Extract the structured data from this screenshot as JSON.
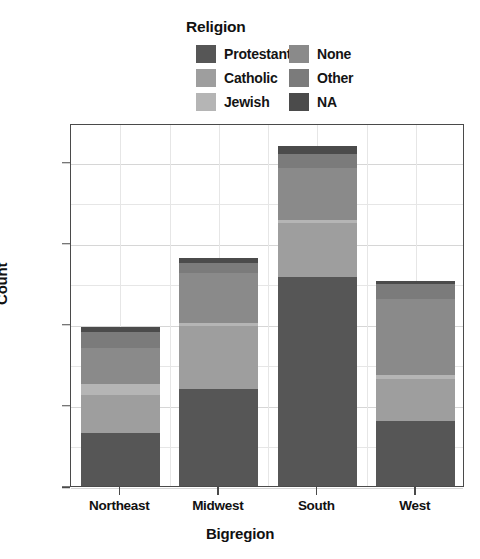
{
  "chart_data": {
    "type": "bar",
    "subtype": "stacked-bar",
    "title": "Religion",
    "xlabel": "Bigregion",
    "ylabel": "Count",
    "categories": [
      "Northeast",
      "Midwest",
      "South",
      "West"
    ],
    "series": [
      {
        "name": "Protestant",
        "color": "#565656",
        "values": [
          165,
          300,
          645,
          200
        ]
      },
      {
        "name": "Catholic",
        "color": "#9e9e9e",
        "values": [
          115,
          195,
          165,
          130
        ]
      },
      {
        "name": "Jewish",
        "color": "#b5b5b5",
        "values": [
          35,
          8,
          10,
          12
        ]
      },
      {
        "name": "None",
        "color": "#8a8a8a",
        "values": [
          110,
          155,
          160,
          235
        ]
      },
      {
        "name": "Other",
        "color": "#7b7b7b",
        "values": [
          50,
          30,
          45,
          45
        ]
      },
      {
        "name": "NA",
        "color": "#4b4b4b",
        "values": [
          15,
          15,
          25,
          10
        ]
      }
    ],
    "totals": [
      490,
      703,
      1050,
      632
    ],
    "ylim": [
      0,
      1120
    ],
    "ytick_values": [
      0,
      250,
      500,
      750,
      1000
    ],
    "ytick_labels": [
      "0",
      "250",
      "500",
      "750",
      "1.00"
    ],
    "minor_ytick_values": [
      125,
      375,
      625,
      875
    ],
    "grid": true,
    "legend_position": "top",
    "legend_columns": 2,
    "legend_entries_left": [
      "Protestant",
      "Catholic",
      "Jewish"
    ],
    "legend_entries_right": [
      "None",
      "Other",
      "NA"
    ]
  },
  "legend": {
    "title": "Religion",
    "columns": [
      {
        "id": "left",
        "items": [
          {
            "label": "Protestant",
            "color": "#565656"
          },
          {
            "label": "Catholic",
            "color": "#9e9e9e"
          },
          {
            "label": "Jewish",
            "color": "#b5b5b5"
          }
        ]
      },
      {
        "id": "right",
        "items": [
          {
            "label": "None",
            "color": "#8a8a8a"
          },
          {
            "label": "Other",
            "color": "#7b7b7b"
          },
          {
            "label": "NA",
            "color": "#4b4b4b"
          }
        ]
      }
    ]
  },
  "axes": {
    "y": {
      "label": "Count",
      "ticks": [
        {
          "label": "1.00",
          "value": 1000
        },
        {
          "label": "750",
          "value": 750
        },
        {
          "label": "500",
          "value": 500
        },
        {
          "label": "250",
          "value": 250
        },
        {
          "label": "0",
          "value": 0
        }
      ]
    },
    "x": {
      "label": "Bigregion",
      "ticks": [
        {
          "label": "Northeast"
        },
        {
          "label": "Midwest"
        },
        {
          "label": "South"
        },
        {
          "label": "West"
        }
      ]
    }
  },
  "style": {
    "frame_color": "#4a4a4a",
    "grid_color": "#d6d6d6",
    "background": "#ffffff"
  }
}
